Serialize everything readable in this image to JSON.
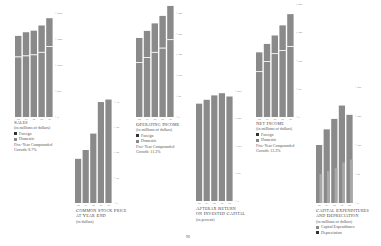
{
  "page": {
    "number": "96"
  },
  "colors": {
    "bar": "#8a8a8a",
    "bar_light": "#a8a8a8",
    "divider": "#ffffff",
    "axis_text": "#777777"
  },
  "chart_data": [
    {
      "id": "sales",
      "type": "bar",
      "stacked": true,
      "title": "Sales",
      "subtitle": "(in millions of dollars)",
      "categories": [
        "'83",
        "'84",
        "'85",
        "'86",
        "'87"
      ],
      "series": [
        {
          "name": "Domestic",
          "values": [
            1150,
            1170,
            1190,
            1240,
            1350
          ]
        },
        {
          "name": "Foreign",
          "values": [
            410,
            460,
            470,
            520,
            550
          ]
        }
      ],
      "legend": [
        "Foreign",
        "Domestic"
      ],
      "growth_label": "Five-Year Compounded",
      "growth_value": "Growth: 8.7%",
      "yticks": [
        "0",
        "500",
        "1000",
        "1500",
        "2000"
      ],
      "ylim": [
        0,
        2000
      ]
    },
    {
      "id": "stock-price",
      "type": "bar",
      "title": "Common Stock Price",
      "title2": "at Year End",
      "subtitle": "(in dollars)",
      "categories": [
        "'83",
        "'84",
        "'85",
        "'86",
        "'87"
      ],
      "values": [
        17.5,
        21,
        27.5,
        40,
        41
      ],
      "yticks": [
        "0",
        "10",
        "20",
        "30",
        "40"
      ],
      "ylim": [
        0,
        42
      ]
    },
    {
      "id": "operating-income",
      "type": "bar",
      "stacked": true,
      "title": "Operating Income",
      "subtitle": "(in millions of dollars)",
      "categories": [
        "'83",
        "'84",
        "'85",
        "'86",
        "'87"
      ],
      "series": [
        {
          "name": "Domestic",
          "values": [
            130,
            142,
            155,
            165,
            185
          ]
        },
        {
          "name": "Foreign",
          "values": [
            60,
            65,
            70,
            78,
            82
          ]
        }
      ],
      "legend": [
        "Foreign",
        "Domestic"
      ],
      "growth_label": "Five-Year Compounded",
      "growth_value": "Growth: 11.2%",
      "yticks": [
        "0",
        "50",
        "100",
        "150",
        "200",
        "250"
      ],
      "ylim": [
        0,
        250
      ]
    },
    {
      "id": "return-on-capital",
      "type": "bar",
      "title": "Afterax Return",
      "title2": "on Invested Capital",
      "subtitle": "(in percent)",
      "categories": [
        "'83",
        "'84",
        "'85",
        "'86",
        "'87"
      ],
      "values": [
        17.7,
        18.4,
        19.2,
        19.6,
        19.0
      ],
      "yticks": [
        "0",
        "5.0",
        "10.0",
        "15.0",
        "20.0"
      ],
      "ylim": [
        0,
        20
      ]
    },
    {
      "id": "net-income",
      "type": "bar",
      "stacked": true,
      "title": "Net Income",
      "subtitle": "(in millions of dollars)",
      "categories": [
        "'83",
        "'84",
        "'85",
        "'86",
        "'87"
      ],
      "series": [
        {
          "name": "Domestic",
          "values": [
            80,
            98,
            112,
            118,
            125
          ]
        },
        {
          "name": "Foreign",
          "values": [
            35,
            32,
            33,
            45,
            58
          ]
        }
      ],
      "legend": [
        "Foreign",
        "Domestic"
      ],
      "growth_label": "Five-Year Compounded",
      "growth_value": "Growth: 13.3%",
      "yticks": [
        "0",
        "50",
        "100",
        "150",
        "200"
      ],
      "ylim": [
        0,
        185
      ]
    },
    {
      "id": "capex",
      "type": "bar",
      "overlay": true,
      "title": "Capital Expenditures",
      "title2": "and Depreciation",
      "subtitle": "(in millions of dollars)",
      "categories": [
        "'83",
        "'84",
        "'85",
        "'86",
        "'87"
      ],
      "series": [
        {
          "name": "Capital Expenditures",
          "values": [
            100,
            127,
            145,
            168,
            152
          ]
        },
        {
          "name": "Depreciation",
          "values": [
            50,
            55,
            60,
            70,
            75
          ]
        }
      ],
      "legend": [
        "Capital Expenditures",
        "Depreciation"
      ],
      "yticks": [
        "0",
        "50",
        "100",
        "150",
        "200"
      ],
      "ylim": [
        0,
        200
      ]
    }
  ]
}
